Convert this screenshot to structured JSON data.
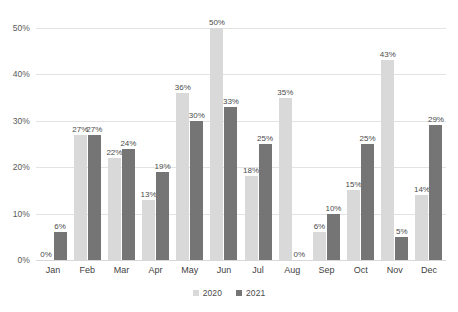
{
  "chart_data": {
    "type": "bar",
    "title": "",
    "subtitle": "",
    "xlabel": "",
    "ylabel": "",
    "ylim": [
      0,
      50
    ],
    "ytick_values": [
      0,
      10,
      20,
      30,
      40,
      50
    ],
    "ytick_labels": [
      "0%",
      "10%",
      "20%",
      "30%",
      "40%",
      "50%"
    ],
    "grid": true,
    "legend_position": "bottom-center",
    "value_suffix": "%",
    "categories": [
      "Jan",
      "Feb",
      "Mar",
      "Apr",
      "May",
      "Jun",
      "Jul",
      "Aug",
      "Sep",
      "Oct",
      "Nov",
      "Dec"
    ],
    "series": [
      {
        "name": "2020",
        "color": "#d9d9d9",
        "values": [
          0,
          27,
          22,
          13,
          36,
          50,
          18,
          35,
          6,
          15,
          43,
          14
        ],
        "labels": [
          "0%",
          "27%",
          "22%",
          "13%",
          "36%",
          "50%",
          "18%",
          "35%",
          "6%",
          "15%",
          "43%",
          "14%"
        ]
      },
      {
        "name": "2021",
        "color": "#757575",
        "values": [
          6,
          27,
          24,
          19,
          30,
          33,
          25,
          0,
          10,
          25,
          5,
          29
        ],
        "labels": [
          "6%",
          "27%",
          "24%",
          "19%",
          "30%",
          "33%",
          "25%",
          "0%",
          "10%",
          "25%",
          "5%",
          "29%"
        ]
      }
    ]
  },
  "legend": {
    "items": [
      {
        "label": "2020",
        "color": "#d9d9d9"
      },
      {
        "label": "2021",
        "color": "#757575"
      }
    ]
  },
  "colors": {
    "series_2020": "#d9d9d9",
    "series_2021": "#757575",
    "gridline": "#e3e3e3",
    "axis_text": "#3f3f3f",
    "label_text": "#4b4b4b",
    "background": "#ffffff"
  }
}
